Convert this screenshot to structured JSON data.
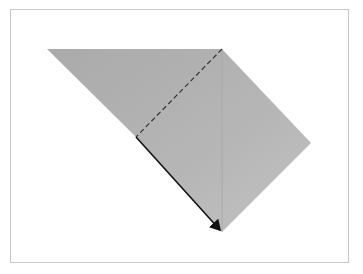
{
  "diagram": {
    "type": "origami-fold-step",
    "colors": {
      "paper": "#b2b2b2",
      "paper_light": "#bdbdbd",
      "fold_line": "#333333",
      "edge": "#111111",
      "frame": "#c8c8c8",
      "background": "#ffffff"
    },
    "shapes": {
      "paper_polygon": "47,49 222,49 311,143 222,232 136,137",
      "valley_fold_line": {
        "x1": 222,
        "y1": 49,
        "x2": 136,
        "y2": 137
      },
      "center_crease": {
        "x1": 222,
        "y1": 49,
        "x2": 222,
        "y2": 232
      },
      "folded_edge": {
        "x1": 136,
        "y1": 137,
        "x2": 222,
        "y2": 232
      }
    }
  }
}
